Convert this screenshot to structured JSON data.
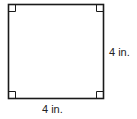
{
  "figure": {
    "shape": "square",
    "stroke_color": "#1a1a1a",
    "right_angle_markers": 4,
    "labels": {
      "right_side": "4 in.",
      "bottom_side": "4 in."
    }
  }
}
